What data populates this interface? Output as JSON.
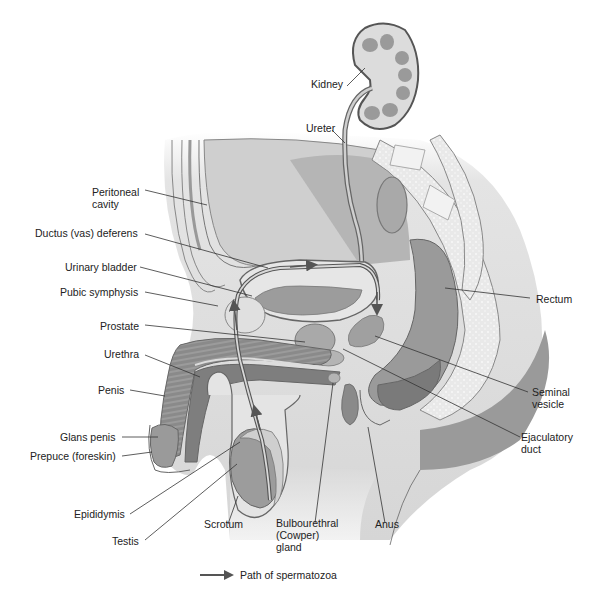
{
  "diagram": {
    "labels": {
      "kidney": "Kidney",
      "ureter": "Ureter",
      "peritoneal_cavity": "Peritoneal\ncavity",
      "ductus_deferens": "Ductus (vas) deferens",
      "urinary_bladder": "Urinary bladder",
      "pubic_symphysis": "Pubic symphysis",
      "prostate": "Prostate",
      "urethra": "Urethra",
      "penis": "Penis",
      "glans_penis": "Glans penis",
      "prepuce": "Prepuce (foreskin)",
      "epididymis": "Epididymis",
      "testis": "Testis",
      "scrotum": "Scrotum",
      "bulbourethral_gland": "Bulbourethral\n(Cowper)\ngland",
      "anus": "Anus",
      "rectum": "Rectum",
      "seminal_vesicle": "Seminal\nvesicle",
      "ejaculatory_duct": "Ejaculatory\nduct"
    },
    "legend": {
      "arrow_label": "Path of spermatozoa"
    },
    "colors": {
      "dark_tissue": "#8a8a8a",
      "mid_tissue": "#a9a9a9",
      "light_tissue": "#d8d8d8",
      "pale_tissue": "#ececec",
      "outline": "#555555",
      "arrow": "#555555"
    }
  }
}
